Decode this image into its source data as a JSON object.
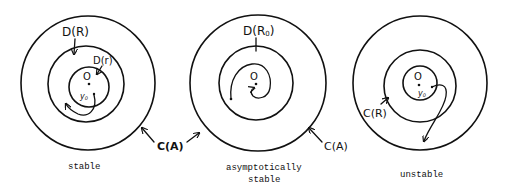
{
  "diagram": {
    "stroke_color": "#111111",
    "background": "#ffffff",
    "panels": [
      {
        "id": "stable",
        "caption": [
          "stable"
        ],
        "labels": {
          "outer_region": "D(R)",
          "inner_region": "D(r)",
          "origin": "O",
          "start_point": "y",
          "start_point_sub": "0",
          "boundary": "C(A)"
        }
      },
      {
        "id": "asymptotically-stable",
        "caption": [
          "asymptotically",
          "stable"
        ],
        "labels": {
          "region": "D(R",
          "region_sub": "0",
          "region_close": ")",
          "origin": "O",
          "boundary_left": "C(A)",
          "boundary_right": "C(A)"
        }
      },
      {
        "id": "unstable",
        "caption": [
          "unstable"
        ],
        "labels": {
          "circle": "C(R)",
          "origin": "O",
          "start_point": "y",
          "start_point_sub": "0"
        }
      }
    ]
  }
}
